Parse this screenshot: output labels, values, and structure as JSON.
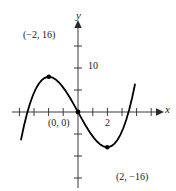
{
  "figure": {
    "name": "cubic-function-graph",
    "background_color": "#ffffff",
    "curve_color": "#000000",
    "axis_color": "#3a3a3a"
  },
  "axes": {
    "x_axis_label": "x",
    "y_axis_label": "y",
    "origin_px": [
      78,
      112
    ],
    "x_tick_spacing_px": 14.6,
    "y_tick_spacing_px": 22,
    "x_range_data": [
      -4.5,
      5.7
    ],
    "y_range_data": [
      -24,
      20
    ]
  },
  "tick_labels": {
    "y_ten": "10",
    "x_two": "2"
  },
  "annotations": [
    {
      "name": "maximum-point-label",
      "text": "(−2, 16)"
    },
    {
      "name": "origin-point-label",
      "text": "(0, 0)"
    },
    {
      "name": "minimum-point-label",
      "text": "(2, −16)"
    }
  ],
  "chart_data": {
    "type": "line",
    "title": "",
    "xlabel": "x",
    "ylabel": "y",
    "grid": false,
    "legend": null,
    "equation": "y = x^3 - 12x",
    "xlim": [
      -4.5,
      5.7
    ],
    "ylim": [
      -24,
      20
    ],
    "x_ticks": [
      -4,
      -3,
      -2,
      -1,
      1,
      2,
      3,
      4,
      5
    ],
    "x_tick_labels": [
      "",
      "",
      "",
      "",
      "",
      "2",
      "",
      "",
      ""
    ],
    "y_ticks": [
      -20,
      -10,
      10,
      20
    ],
    "y_tick_labels": [
      "",
      "",
      "10",
      ""
    ],
    "marked_points": [
      {
        "label": "(−2, 16)",
        "x": -2,
        "y": 16,
        "type": "local-maximum",
        "marker": "dot"
      },
      {
        "label": "(0, 0)",
        "x": 0,
        "y": 0,
        "type": "inflection-origin",
        "marker": "dot"
      },
      {
        "label": "(2, −16)",
        "x": 2,
        "y": -16,
        "type": "local-minimum",
        "marker": "dot"
      }
    ],
    "series": [
      {
        "name": "y = x^3 - 12x",
        "x": [
          -3.9,
          -3.7,
          -3.5,
          -3.3,
          -3.1,
          -2.9,
          -2.7,
          -2.5,
          -2.3,
          -2.1,
          -1.9,
          -1.7,
          -1.5,
          -1.3,
          -1.1,
          -0.9,
          -0.7,
          -0.5,
          -0.3,
          -0.1,
          0.1,
          0.3,
          0.5,
          0.7,
          0.9,
          1.1,
          1.3,
          1.5,
          1.7,
          1.9,
          2.1,
          2.3,
          2.5,
          2.7,
          2.9,
          3.1,
          3.3,
          3.5,
          3.7,
          3.9
        ],
        "values": [
          -12.52,
          -6.25,
          -0.87,
          3.66,
          7.39,
          10.41,
          12.71,
          14.38,
          15.43,
          15.94,
          15.95,
          15.49,
          14.63,
          13.4,
          11.87,
          10.07,
          8.06,
          5.88,
          3.57,
          1.2,
          -1.2,
          -3.57,
          -5.88,
          -8.06,
          -10.07,
          -11.87,
          -13.4,
          -14.63,
          -15.49,
          -15.95,
          -15.94,
          -15.43,
          -14.38,
          -12.71,
          -10.41,
          -7.39,
          -3.66,
          0.87,
          6.25,
          12.52
        ]
      }
    ]
  }
}
